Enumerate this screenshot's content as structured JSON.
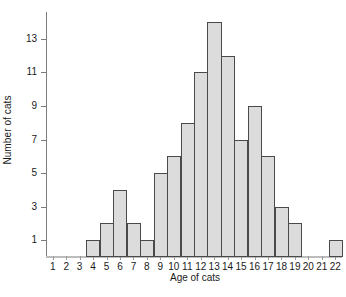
{
  "chart_data": {
    "type": "bar",
    "title": "",
    "xlabel": "Age of cats",
    "ylabel": "Number of cats",
    "categories": [
      "1",
      "2",
      "3",
      "4",
      "5",
      "6",
      "7",
      "8",
      "9",
      "10",
      "11",
      "12",
      "13",
      "14",
      "15",
      "16",
      "17",
      "18",
      "19",
      "20",
      "21",
      "22"
    ],
    "values": [
      0,
      0,
      0,
      1,
      2,
      4,
      2,
      1,
      5,
      6,
      8,
      11,
      14,
      12,
      7,
      9,
      6,
      3,
      2,
      0,
      0,
      1
    ],
    "ylim": [
      0,
      14.6
    ],
    "xlim": [
      0.5,
      22.5
    ],
    "y_ticks": [
      "1",
      "3",
      "5",
      "7",
      "9",
      "11",
      "13"
    ],
    "y_tick_values": [
      1,
      3,
      5,
      7,
      9,
      11,
      13
    ],
    "grid": false,
    "legend": false,
    "bar_fill_color": "#dcdcdc",
    "bar_edge_color": "#4a4a4a",
    "axis_color": "#7d7d7d",
    "text_color": "#1a1a1a"
  }
}
